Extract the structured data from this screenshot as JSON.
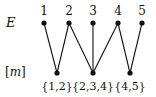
{
  "diagram": {
    "row_labels": {
      "top": "E",
      "bottom": "[m]"
    },
    "top_nodes": [
      {
        "id": "1",
        "label": "1",
        "x": 44
      },
      {
        "id": "2",
        "label": "2",
        "x": 69
      },
      {
        "id": "3",
        "label": "3",
        "x": 93
      },
      {
        "id": "4",
        "label": "4",
        "x": 118
      },
      {
        "id": "5",
        "label": "5",
        "x": 142
      }
    ],
    "bottom_nodes": [
      {
        "id": "b1",
        "label": "{1,2}",
        "x": 57
      },
      {
        "id": "b2",
        "label": "{2,3,4}",
        "x": 93
      },
      {
        "id": "b3",
        "label": "{4,5}",
        "x": 130
      }
    ],
    "edges": [
      [
        "1",
        "b1"
      ],
      [
        "2",
        "b1"
      ],
      [
        "2",
        "b2"
      ],
      [
        "3",
        "b2"
      ],
      [
        "4",
        "b2"
      ],
      [
        "4",
        "b3"
      ],
      [
        "5",
        "b3"
      ]
    ],
    "colors": {
      "ink": "#111111",
      "background": "#ffffff"
    }
  }
}
